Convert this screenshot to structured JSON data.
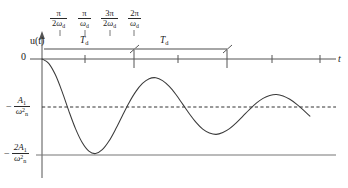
{
  "figure": {
    "background": "#ffffff",
    "curve_color": "#3a3a3a",
    "axis_color": "#555555",
    "text_color": "#1a1a1a"
  },
  "axes": {
    "y_axis_label": "u(t)",
    "x_axis_label": "t",
    "origin_label": "0",
    "x_axis_y_px": 59,
    "y_axis_x_px": 42
  },
  "top_tick_labels": [
    {
      "numerator": "π",
      "denominator_prefix": "2",
      "denominator_symbol": "ω",
      "denominator_sub": "d",
      "text": "π/2ω_d"
    },
    {
      "numerator": "π",
      "denominator_prefix": "",
      "denominator_symbol": "ω",
      "denominator_sub": "d",
      "text": "π/ω_d"
    },
    {
      "numerator": "3π",
      "denominator_prefix": "2",
      "denominator_symbol": "ω",
      "denominator_sub": "d",
      "text": "3π/2ω_d"
    },
    {
      "numerator": "2π",
      "denominator_prefix": "",
      "denominator_symbol": "ω",
      "denominator_sub": "d",
      "text": "2π/ω_d"
    }
  ],
  "period_brackets": [
    {
      "label_main": "T",
      "label_sub": "d",
      "text": "T_d"
    },
    {
      "label_main": "T",
      "label_sub": "d",
      "text": "T_d"
    }
  ],
  "y_level_labels": [
    {
      "sign": "−",
      "numerator_main": "A",
      "numerator_sub": "1",
      "denominator_main": "ω",
      "denominator_sup": "2",
      "denominator_sub": "n",
      "text": "− A₁/ω²ₙ",
      "style": "dashed"
    },
    {
      "sign": "−",
      "numerator_main": "2A",
      "numerator_sub": "1",
      "denominator_main": "ω",
      "denominator_sup": "2",
      "denominator_sub": "n",
      "text": "− 2A₁/ω²ₙ",
      "style": "solid"
    }
  ],
  "chart_data": {
    "type": "line",
    "xlabel": "t",
    "ylabel": "u(t)",
    "grid": false,
    "legend": null,
    "annotations": [
      "π/2ω_d",
      "π/ω_d",
      "3π/2ω_d",
      "2π/ω_d",
      "T_d",
      "T_d",
      "0",
      "t",
      "u(t)",
      "−A₁/ω²ₙ",
      "−2A₁/ω²ₙ"
    ],
    "reference_lines": [
      {
        "name": "steady-state",
        "y_value": -1.0,
        "style": "dashed",
        "label": "−A₁/ω²ₙ"
      },
      {
        "name": "lower-envelope",
        "y_value": -2.0,
        "style": "solid",
        "label": "−2A₁/ω²ₙ"
      },
      {
        "name": "zero-axis",
        "y_value": 0.0,
        "style": "solid",
        "label": "0"
      }
    ],
    "ylim": [
      -2.15,
      0.18
    ],
    "xlim": [
      0,
      4.3
    ],
    "x_tick_values": [
      0.25,
      0.5,
      0.75,
      1.0,
      1.5,
      2.0,
      2.75,
      3.5
    ],
    "x_tick_labels": [
      "π/2ω_d",
      "π/ω_d",
      "3π/2ω_d",
      "2π/ω_d",
      "",
      "",
      "",
      ""
    ],
    "series": [
      {
        "name": "u(t)",
        "formula": "u(t) = -(A1/wn^2) * (1 - e^{-zeta*wn*t} * cos(wd*t))",
        "description": "Underdamped oscillation decaying toward -A1/wn^2, first trough touching -2A1/wn^2",
        "x": [
          0.0,
          0.1,
          0.2,
          0.3,
          0.4,
          0.5,
          0.6,
          0.7,
          0.8,
          0.9,
          1.0,
          1.1,
          1.2,
          1.3,
          1.4,
          1.5,
          1.6,
          1.7,
          1.8,
          1.9,
          2.0,
          2.1,
          2.2,
          2.3,
          2.4,
          2.5,
          2.6,
          2.7,
          2.8,
          2.9,
          3.0,
          3.1,
          3.2,
          3.3,
          3.4,
          3.5,
          3.6,
          3.7,
          3.8,
          3.9,
          4.0
        ],
        "y": [
          0.0,
          -0.09,
          -0.33,
          -0.68,
          -1.08,
          -1.45,
          -1.74,
          -1.92,
          -1.97,
          -1.89,
          -1.71,
          -1.46,
          -1.18,
          -0.91,
          -0.68,
          -0.51,
          -0.41,
          -0.39,
          -0.45,
          -0.57,
          -0.74,
          -0.94,
          -1.14,
          -1.32,
          -1.46,
          -1.54,
          -1.57,
          -1.53,
          -1.45,
          -1.33,
          -1.19,
          -1.05,
          -0.92,
          -0.82,
          -0.76,
          -0.74,
          -0.77,
          -0.84,
          -0.94,
          -1.06,
          -1.19
        ]
      }
    ]
  }
}
